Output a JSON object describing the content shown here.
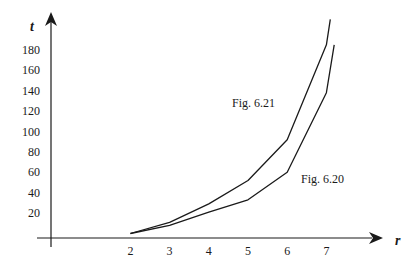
{
  "chart_data": {
    "type": "line",
    "title": "",
    "xlabel": "r",
    "ylabel": "t",
    "xlim": [
      0,
      8
    ],
    "ylim": [
      0,
      200
    ],
    "x_ticks": [
      2,
      3,
      4,
      5,
      6,
      7
    ],
    "y_ticks": [
      20,
      40,
      60,
      80,
      100,
      120,
      140,
      160,
      180
    ],
    "grid": false,
    "legend": "none (curves labeled inline)",
    "series": [
      {
        "name": "Fig. 6.21",
        "x": [
          2,
          3,
          4,
          5,
          6,
          7,
          7.1
        ],
        "values": [
          0,
          11,
          29,
          52,
          92,
          185,
          210
        ]
      },
      {
        "name": "Fig. 6.20",
        "x": [
          2,
          3,
          4,
          5,
          6,
          7,
          7.2
        ],
        "values": [
          0,
          8,
          21,
          33,
          60,
          138,
          185
        ]
      }
    ],
    "annotations": [
      {
        "text": "Fig. 6.21",
        "near_series": "Fig. 6.21"
      },
      {
        "text": "Fig. 6.20",
        "near_series": "Fig. 6.20"
      }
    ]
  },
  "labels": {
    "x_axis": "r",
    "y_axis": "t",
    "annot_upper": "Fig. 6.21",
    "annot_lower": "Fig. 6.20"
  },
  "colors": {
    "line": "#1a1a1a",
    "background": "#ffffff"
  }
}
